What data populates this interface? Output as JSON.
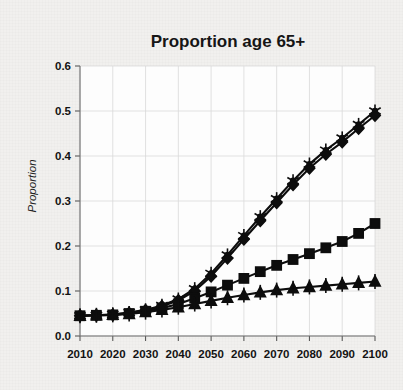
{
  "chart_data": {
    "type": "line",
    "title": "Proportion age 65+",
    "xlabel": "",
    "ylabel": "Proportion",
    "xlim": [
      2010,
      2100
    ],
    "ylim": [
      0.0,
      0.6
    ],
    "ytick_labels": [
      "0.0",
      "0.1",
      "0.2",
      "0.3",
      "0.4",
      "0.5",
      "0.6"
    ],
    "ytick_values": [
      0.0,
      0.1,
      0.2,
      0.3,
      0.4,
      0.5,
      0.6
    ],
    "xtick_labels": [
      "2010",
      "2020",
      "2030",
      "2040",
      "2050",
      "2060",
      "2070",
      "2080",
      "2090",
      "2100"
    ],
    "xtick_values": [
      2010,
      2020,
      2030,
      2040,
      2050,
      2060,
      2070,
      2080,
      2090,
      2100
    ],
    "x": [
      2010,
      2015,
      2020,
      2025,
      2030,
      2035,
      2040,
      2045,
      2050,
      2055,
      2060,
      2065,
      2070,
      2075,
      2080,
      2085,
      2090,
      2095,
      2100
    ],
    "grid": true,
    "legend": "none",
    "series": [
      {
        "name": "star-series",
        "marker": "star",
        "color": "#0d0d0d",
        "values": [
          0.045,
          0.046,
          0.048,
          0.052,
          0.058,
          0.068,
          0.082,
          0.105,
          0.139,
          0.18,
          0.223,
          0.265,
          0.305,
          0.345,
          0.382,
          0.413,
          0.44,
          0.47,
          0.5
        ]
      },
      {
        "name": "diamond-series",
        "marker": "diamond",
        "color": "#0d0d0d",
        "values": [
          0.045,
          0.046,
          0.047,
          0.051,
          0.057,
          0.066,
          0.079,
          0.1,
          0.133,
          0.173,
          0.215,
          0.256,
          0.296,
          0.336,
          0.373,
          0.404,
          0.431,
          0.461,
          0.49
        ]
      },
      {
        "name": "square-series",
        "marker": "square",
        "color": "#0d0d0d",
        "values": [
          0.045,
          0.046,
          0.047,
          0.05,
          0.055,
          0.062,
          0.071,
          0.084,
          0.098,
          0.113,
          0.128,
          0.143,
          0.157,
          0.17,
          0.183,
          0.196,
          0.21,
          0.228,
          0.25
        ]
      },
      {
        "name": "triangle-series",
        "marker": "triangle",
        "color": "#0d0d0d",
        "values": [
          0.045,
          0.046,
          0.047,
          0.049,
          0.053,
          0.058,
          0.064,
          0.071,
          0.078,
          0.085,
          0.091,
          0.097,
          0.102,
          0.106,
          0.109,
          0.112,
          0.115,
          0.118,
          0.121
        ]
      }
    ]
  }
}
